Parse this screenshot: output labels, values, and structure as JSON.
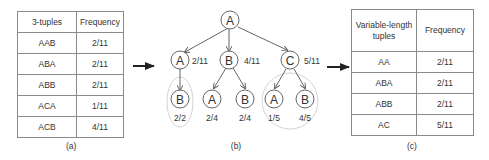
{
  "panel_a": {
    "caption": "(a)",
    "headers": [
      "3-tuples",
      "Frequency"
    ],
    "rows": [
      {
        "tuple": "AAB",
        "freq": "2/11"
      },
      {
        "tuple": "ABA",
        "freq": "2/11"
      },
      {
        "tuple": "ABB",
        "freq": "2/11"
      },
      {
        "tuple": "ACA",
        "freq": "1/11"
      },
      {
        "tuple": "ACB",
        "freq": "4/11"
      }
    ]
  },
  "panel_b": {
    "caption": "(b)",
    "root": {
      "label": "A"
    },
    "level1": [
      {
        "label": "A",
        "freq": "2/11"
      },
      {
        "label": "B",
        "freq": "4/11"
      },
      {
        "label": "C",
        "freq": "5/11"
      }
    ],
    "level2": [
      {
        "label": "B",
        "freq": "2/2"
      },
      {
        "label": "A",
        "freq": "2/4"
      },
      {
        "label": "B",
        "freq": "2/4"
      },
      {
        "label": "A",
        "freq": "1/5"
      },
      {
        "label": "B",
        "freq": "4/5"
      }
    ]
  },
  "panel_c": {
    "caption": "(c)",
    "headers": [
      "Variable-length tuples",
      "Frequency"
    ],
    "header_line1": "Variable-length",
    "header_line2": "tuples",
    "rows": [
      {
        "tuple": "AA",
        "freq": "2/11"
      },
      {
        "tuple": "ABA",
        "freq": "2/11"
      },
      {
        "tuple": "ABB",
        "freq": "2/11"
      },
      {
        "tuple": "AC",
        "freq": "5/11"
      }
    ]
  }
}
